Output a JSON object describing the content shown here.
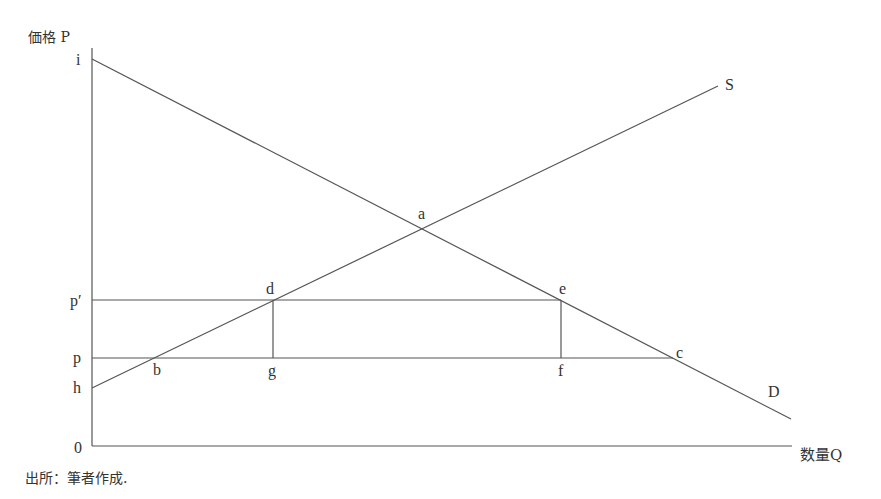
{
  "axes": {
    "y_label": "価格 P",
    "x_label": "数量Q",
    "origin": "0"
  },
  "price_levels": {
    "i": "i",
    "p_prime": "p′",
    "p": "p",
    "h": "h"
  },
  "curves": {
    "supply": "S",
    "demand": "D"
  },
  "points": {
    "a": "a",
    "b": "b",
    "c": "c",
    "d": "d",
    "e": "e",
    "f": "f",
    "g": "g"
  },
  "source": "出所：筆者作成."
}
